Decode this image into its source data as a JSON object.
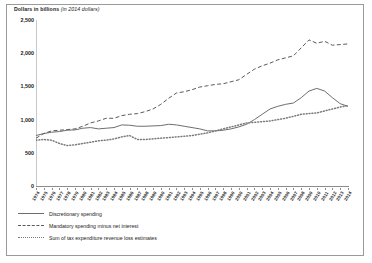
{
  "title": {
    "bold": "Dollars in billions",
    "italic": "(in 2014 dollars)"
  },
  "legend": [
    {
      "label": "Discretionary spending",
      "style": "solid",
      "color": "#6e6e6e"
    },
    {
      "label": "Mandatory spending minus net interest",
      "style": "dashed",
      "color": "#5a5a5a"
    },
    {
      "label": "Sum of tax expenditure revenue loss estimates",
      "style": "dotted",
      "color": "#7b7b7b"
    }
  ],
  "chart_data": {
    "type": "line",
    "title": "Dollars in billions (in 2014 dollars)",
    "xlabel": "",
    "ylabel": "Dollars in billions",
    "ylim": [
      0,
      2500
    ],
    "yticks": [
      0,
      500,
      1000,
      1500,
      2000,
      2500
    ],
    "ytick_labels": [
      "0",
      "500",
      "1,000",
      "1,500",
      "2,000",
      "2,500"
    ],
    "grid": false,
    "legend_position": "below-left",
    "x": [
      1974,
      1975,
      1976,
      1977,
      1978,
      1979,
      1980,
      1981,
      1982,
      1983,
      1984,
      1985,
      1986,
      1987,
      1988,
      1989,
      1990,
      1991,
      1992,
      1993,
      1994,
      1995,
      1996,
      1997,
      1998,
      1999,
      2000,
      2001,
      2002,
      2003,
      2004,
      2005,
      2006,
      2007,
      2008,
      2009,
      2010,
      2011,
      2012,
      2013,
      2014
    ],
    "series": [
      {
        "name": "Discretionary spending",
        "style": "solid",
        "values": [
          760,
          790,
          810,
          820,
          840,
          845,
          870,
          880,
          860,
          870,
          880,
          920,
          915,
          900,
          900,
          905,
          910,
          930,
          920,
          900,
          880,
          860,
          830,
          830,
          840,
          860,
          890,
          930,
          1000,
          1080,
          1160,
          1200,
          1230,
          1250,
          1330,
          1430,
          1470,
          1430,
          1330,
          1240,
          1200
        ]
      },
      {
        "name": "Mandatory spending minus net interest",
        "style": "dashed",
        "values": [
          720,
          790,
          830,
          840,
          850,
          860,
          900,
          950,
          980,
          1020,
          1020,
          1060,
          1080,
          1090,
          1120,
          1160,
          1230,
          1320,
          1400,
          1420,
          1450,
          1490,
          1510,
          1530,
          1540,
          1570,
          1600,
          1680,
          1760,
          1810,
          1850,
          1900,
          1930,
          1960,
          2080,
          2200,
          2150,
          2180,
          2120,
          2130,
          2140
        ]
      },
      {
        "name": "Sum of tax expenditure revenue loss estimates",
        "style": "dotted",
        "values": [
          690,
          700,
          690,
          640,
          610,
          620,
          640,
          660,
          680,
          690,
          710,
          740,
          760,
          700,
          700,
          710,
          720,
          730,
          740,
          750,
          760,
          780,
          800,
          830,
          860,
          890,
          920,
          950,
          960,
          970,
          980,
          1000,
          1020,
          1050,
          1080,
          1090,
          1100,
          1130,
          1160,
          1190,
          1210
        ]
      }
    ]
  }
}
